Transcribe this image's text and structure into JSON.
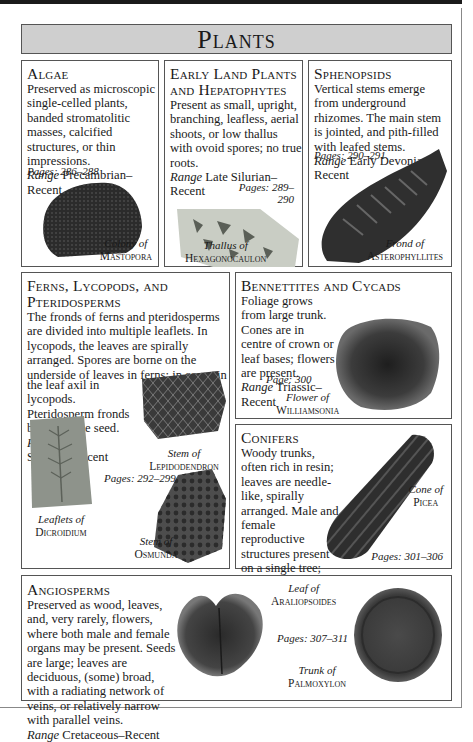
{
  "page": {
    "title": "Plants"
  },
  "sections": {
    "algae": {
      "heading": "Algae",
      "body": "Preserved as microscopic single-celled plants, banded stromatolitic masses, calcified structures, or thin impressions.",
      "range_label": "Range",
      "range": "Precambrian–Recent",
      "pages": "Pages: 286–288",
      "caption": {
        "line1": "Colony of",
        "line2": "Mastopora"
      }
    },
    "early_land": {
      "heading_line1": "Early Land Plants",
      "heading_line2": "and Hepatophytes",
      "body": "Present as small, upright, branching, leafless, aerial shoots, or low thallus with ovoid spores; no true roots.",
      "range_label": "Range",
      "range": "Late Silurian–Recent",
      "pages_line1": "Pages: 289–",
      "pages_line2": "290",
      "caption": {
        "line1": "Thallus of",
        "line2": "Hexagonocaulon"
      }
    },
    "sphenopsids": {
      "heading": "Sphenopsids",
      "body": "Vertical stems emerge from underground rhizomes. The main stem is jointed, and pith-filled with leafed stems.",
      "range_label": "Range",
      "range": "Early Devonian–Recent",
      "pages": "Pages: 290–291",
      "caption": {
        "line1": "Frond of",
        "line2": "Asterophyllites"
      }
    },
    "ferns": {
      "heading_line1": "Ferns, Lycopods, and",
      "heading_line2": "Pteridosperms",
      "body_wide": "The fronds of ferns and pteridosperms are divided into multiple leaflets. In lycopods, the leaves are spirally arranged. Spores are borne on the underside of leaves in ferns; in cones in",
      "body_narrow": "the leaf axil in lycopods. Pteridosperm fronds bear a single seed.",
      "range_label": "Range",
      "range_line1": "Late",
      "range_line2": "Silurian–Recent",
      "pages": "Pages: 292–299",
      "captions": [
        {
          "line1": "Stem of",
          "line2": "Lepidodendron"
        },
        {
          "line1": "Leaflets of",
          "line2": "Dicroidium"
        },
        {
          "line1": "Stem of",
          "line2": "Osmunda"
        }
      ]
    },
    "bennettites": {
      "heading": "Bennettites and Cycads",
      "body": "Foliage grows from large trunk. Cones are in centre of crown or leaf bases; flowers are present.",
      "range_label": "Range",
      "range": "Triassic–Recent",
      "pages": "Page: 300",
      "caption": {
        "line1": "Flower of",
        "line2": "Williamsonia"
      }
    },
    "conifers": {
      "heading": "Conifers",
      "body": "Woody trunks, often rich in resin; leaves are needle-like, spirally arranged. Male and female reproductive structures present on a single tree; seeds in cones.",
      "range_label": "Range",
      "range": "Late Carboniferous –Recent",
      "pages": "Pages: 301–306",
      "caption": {
        "line1": "Cone of",
        "line2": "Picea"
      }
    },
    "angiosperms": {
      "heading": "Angiosperms",
      "body": "Preserved as wood, leaves, and, very rarely, flowers, where both male and female organs may be present. Seeds are large; leaves are deciduous, (some) broad, with a radiating network of veins, or relatively narrow with parallel veins.",
      "range_label": "Range",
      "range": "Cretaceous–Recent",
      "pages": "Pages: 307–311",
      "captions": [
        {
          "line1": "Leaf of",
          "line2": "Araliopsoides"
        },
        {
          "line1": "Trunk of",
          "line2": "Palmoxylon"
        }
      ]
    }
  }
}
